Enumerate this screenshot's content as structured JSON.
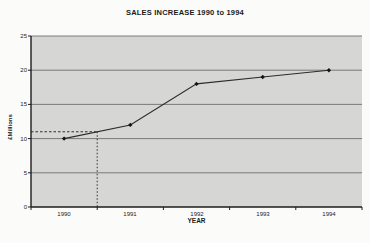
{
  "page_bg": "#fbfbfa",
  "chart_data": {
    "type": "line",
    "title": "SALES INCREASE 1990 to 1994",
    "xlabel": "YEAR",
    "ylabel": "£Millions",
    "categories": [
      "1990",
      "1991",
      "1992",
      "1993",
      "1994"
    ],
    "values": [
      10,
      12,
      18,
      19,
      20
    ],
    "ylim": [
      0,
      25
    ],
    "yticks": [
      25,
      20,
      15,
      10,
      5,
      0
    ],
    "grid": "horizontal",
    "legend": "none",
    "annotation": {
      "type": "dashed-guide-lines",
      "value": 11,
      "boundary_index": 1,
      "reads": "approx. 11 midway between 1990 and 1991"
    },
    "colors": {
      "plot_bg": "#d6d6d4",
      "gridline": "#6f6f6f",
      "axis": "#1c1c1c",
      "line": "#2b2b2b",
      "marker": "#141414",
      "dashed": "#1c1c1c"
    }
  }
}
